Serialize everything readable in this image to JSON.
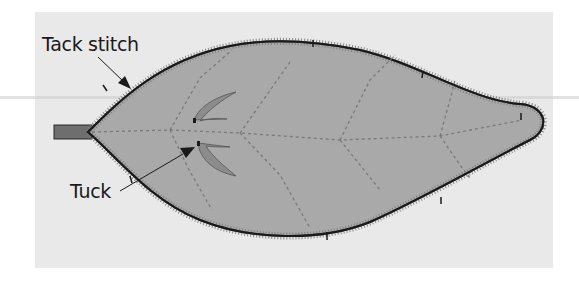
{
  "diagram": {
    "labels": {
      "tack_stitch": "Tack stitch",
      "tuck": "Tuck"
    },
    "colors": {
      "background_panel": "#e9e9e9",
      "leaf_fill": "#a9a9a9",
      "outline": "#1a1a1a",
      "zigzag_stitch": "#7d7d7d",
      "vein_dashes": "#7a7a7a",
      "stem": "#6e6e6e",
      "tuck_fill": "#8c8c8c"
    },
    "parts": [
      "leaf",
      "stem",
      "zigzag edge stitch",
      "dashed veins",
      "two tucks",
      "tack stitch marks"
    ]
  }
}
